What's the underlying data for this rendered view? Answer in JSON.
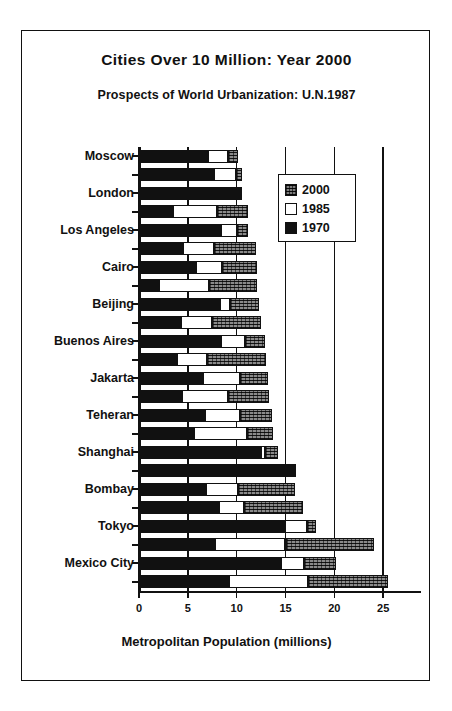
{
  "chart_data": {
    "type": "bar",
    "orientation": "horizontal",
    "stacked": true,
    "title": "Cities Over 10 Million: Year 2000",
    "subtitle": "Prospects of World Urbanization: U.N.1987",
    "xlabel": "Metropolitan Population (millions)",
    "ylabel": "",
    "xlim": [
      0,
      25.8
    ],
    "xticks": [
      0,
      5,
      10,
      15,
      20,
      25
    ],
    "xticklabels": [
      "0",
      "5",
      "10",
      "15",
      "20",
      "25"
    ],
    "grid": true,
    "legend_position": "upper right",
    "legend": [
      "2000",
      "1985",
      "1970"
    ],
    "series": [
      {
        "name": "1970",
        "color": "#111111",
        "fill": "solid"
      },
      {
        "name": "1985",
        "color": "#ffffff",
        "fill": "open"
      },
      {
        "name": "2000",
        "color": "#8a8a8a",
        "fill": "hatched"
      }
    ],
    "categories": [
      "Moscow",
      "London",
      "Los Angeles",
      "Cairo",
      "Beijing",
      "Buenos Aires",
      "Jakarta",
      "Teheran",
      "Shanghai",
      "Bombay",
      "Tokyo",
      "Mexico City"
    ],
    "bars": [
      {
        "label": "Moscow",
        "labeled": true,
        "v1970": 7.1,
        "v1985": 9.1,
        "v2000": 10.1
      },
      {
        "label": "",
        "labeled": false,
        "v1970": 7.7,
        "v1985": 9.9,
        "v2000": 10.5
      },
      {
        "label": "London",
        "labeled": true,
        "v1970": 10.5,
        "v1985": 10.5,
        "v2000": 10.5
      },
      {
        "label": "",
        "labeled": false,
        "v1970": 3.5,
        "v1985": 8.0,
        "v2000": 11.2
      },
      {
        "label": "Los Angeles",
        "labeled": true,
        "v1970": 8.4,
        "v1985": 10.0,
        "v2000": 11.2
      },
      {
        "label": "",
        "labeled": false,
        "v1970": 4.5,
        "v1985": 7.7,
        "v2000": 12.0
      },
      {
        "label": "Cairo",
        "labeled": true,
        "v1970": 5.8,
        "v1985": 8.5,
        "v2000": 12.1
      },
      {
        "label": "",
        "labeled": false,
        "v1970": 2.0,
        "v1985": 7.2,
        "v2000": 12.1
      },
      {
        "label": "Beijing",
        "labeled": true,
        "v1970": 8.3,
        "v1985": 9.3,
        "v2000": 12.3
      },
      {
        "label": "",
        "labeled": false,
        "v1970": 4.3,
        "v1985": 7.5,
        "v2000": 12.5
      },
      {
        "label": "Buenos Aires",
        "labeled": true,
        "v1970": 8.4,
        "v1985": 10.9,
        "v2000": 12.9
      },
      {
        "label": "",
        "labeled": false,
        "v1970": 3.9,
        "v1985": 7.0,
        "v2000": 13.0
      },
      {
        "label": "Jakarta",
        "labeled": true,
        "v1970": 6.6,
        "v1985": 10.3,
        "v2000": 13.2
      },
      {
        "label": "",
        "labeled": false,
        "v1970": 4.4,
        "v1985": 9.1,
        "v2000": 13.3
      },
      {
        "label": "Teheran",
        "labeled": true,
        "v1970": 6.8,
        "v1985": 10.3,
        "v2000": 13.6
      },
      {
        "label": "",
        "labeled": false,
        "v1970": 5.6,
        "v1985": 11.1,
        "v2000": 13.7
      },
      {
        "label": "Shanghai",
        "labeled": true,
        "v1970": 12.5,
        "v1985": 12.9,
        "v2000": 14.2
      },
      {
        "label": "",
        "labeled": false,
        "v1970": 16.1,
        "v1985": 16.1,
        "v2000": 16.1
      },
      {
        "label": "Bombay",
        "labeled": true,
        "v1970": 6.9,
        "v1985": 10.1,
        "v2000": 16.0
      },
      {
        "label": "",
        "labeled": false,
        "v1970": 8.2,
        "v1985": 10.8,
        "v2000": 16.8
      },
      {
        "label": "Tokyo",
        "labeled": true,
        "v1970": 14.9,
        "v1985": 17.2,
        "v2000": 18.1
      },
      {
        "label": "",
        "labeled": false,
        "v1970": 7.8,
        "v1985": 15.0,
        "v2000": 24.1
      },
      {
        "label": "Mexico City",
        "labeled": true,
        "v1970": 14.5,
        "v1985": 16.9,
        "v2000": 20.2
      },
      {
        "label": "",
        "labeled": false,
        "v1970": 9.2,
        "v1985": 17.3,
        "v2000": 25.5
      }
    ]
  }
}
